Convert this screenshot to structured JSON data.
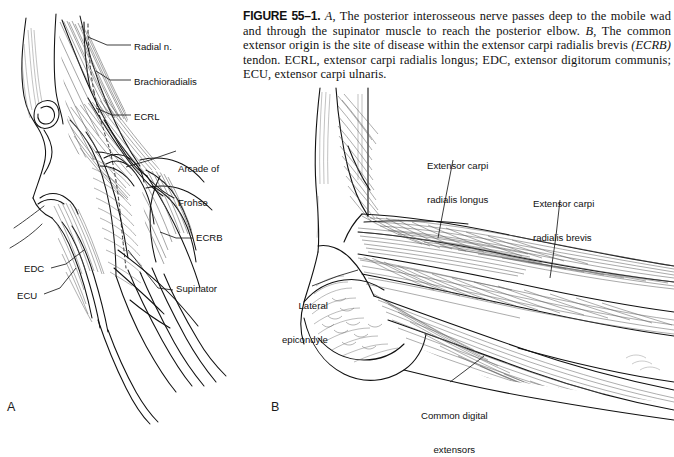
{
  "figure": {
    "number_label": "FIGURE 55–1.",
    "caption_parts": {
      "a_marker": "A",
      "a_text": ", The posterior interosseous nerve passes deep to the mobile wad and through the supinator muscle to reach the posterior elbow. ",
      "b_marker": "B",
      "b_text": ", The common extensor origin is the site of disease within the extensor carpi radialis brevis ",
      "ecrb_paren": "(ECRB)",
      "tail_text": " tendon. ECRL, extensor carpi radialis longus; EDC, extensor digitorum communis; ECU, extensor carpi ulnaris."
    }
  },
  "panels": [
    {
      "letter": "A",
      "name": "posterior-interosseous-nerve-view",
      "labels": [
        {
          "id": "radial-n",
          "text": "Radial n."
        },
        {
          "id": "brachioradialis",
          "text": "Brachioradialis"
        },
        {
          "id": "ecrl",
          "text": "ECRL"
        },
        {
          "id": "arcade-frohse",
          "line1": "Arcade of",
          "line2": "Frohse"
        },
        {
          "id": "ecrb",
          "text": "ECRB"
        },
        {
          "id": "supinator",
          "text": "Supinator"
        },
        {
          "id": "edc",
          "text": "EDC"
        },
        {
          "id": "ecu",
          "text": "ECU"
        }
      ]
    },
    {
      "letter": "B",
      "name": "common-extensor-origin-view",
      "labels": [
        {
          "id": "ecrl-long",
          "line1": "Extensor carpi",
          "line2": "radialis longus"
        },
        {
          "id": "ecrb-brev",
          "line1": "Extensor carpi",
          "line2": "radialis brevis"
        },
        {
          "id": "lat-epi",
          "line1": "Lateral",
          "line2": "epicondyle"
        },
        {
          "id": "common-dig",
          "line1": "Common digital",
          "line2": "extensors"
        }
      ]
    }
  ],
  "colors": {
    "background": "#ffffff",
    "ink": "#111111",
    "hatch": "#4a4a4a",
    "leader": "#1a1a1a"
  }
}
